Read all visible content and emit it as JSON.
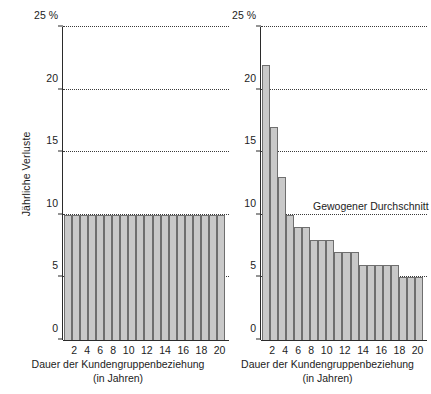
{
  "chart_data": [
    {
      "type": "bar",
      "panel": "left",
      "title": "",
      "xlabel": "Dauer der Kundengruppenbeziehung (in Jahren)",
      "xlabel_line1": "Dauer der Kundengruppenbeziehung",
      "xlabel_line2": "(in Jahren)",
      "ylabel": "Jährliche Verluste",
      "ylim": [
        0,
        25
      ],
      "yticks": [
        0,
        5,
        10,
        15,
        20,
        25
      ],
      "ytick_labels": [
        "0",
        "5",
        "10",
        "15",
        "20",
        "25 %"
      ],
      "grid": true,
      "grid_values": [
        5,
        10,
        15,
        20,
        25
      ],
      "x": [
        1,
        2,
        3,
        4,
        5,
        6,
        7,
        8,
        9,
        10,
        11,
        12,
        13,
        14,
        15,
        16,
        17,
        18,
        19,
        20
      ],
      "xtick_labels": [
        "",
        "2",
        "",
        "4",
        "",
        "6",
        "",
        "8",
        "",
        "10",
        "",
        "12",
        "",
        "14",
        "",
        "16",
        "",
        "18",
        "",
        "20"
      ],
      "categories": [
        "1",
        "2",
        "3",
        "4",
        "5",
        "6",
        "7",
        "8",
        "9",
        "10",
        "11",
        "12",
        "13",
        "14",
        "15",
        "16",
        "17",
        "18",
        "19",
        "20"
      ],
      "values": [
        10,
        10,
        10,
        10,
        10,
        10,
        10,
        10,
        10,
        10,
        10,
        10,
        10,
        10,
        10,
        10,
        10,
        10,
        10,
        10
      ],
      "bar_fill": "#c9c9c9",
      "bar_edge": "#6f6f6f"
    },
    {
      "type": "bar",
      "panel": "right",
      "title": "",
      "xlabel": "Dauer der Kundengruppenbeziehung (in Jahren)",
      "xlabel_line1": "Dauer der Kundengruppenbeziehung",
      "xlabel_line2": "(in Jahren)",
      "ylabel": "Jährliche Verluste",
      "ylim": [
        0,
        25
      ],
      "yticks": [
        0,
        5,
        10,
        15,
        20,
        25
      ],
      "ytick_labels": [
        "0",
        "5",
        "10",
        "15",
        "20",
        "25 %"
      ],
      "grid": true,
      "grid_values": [
        5,
        10,
        15,
        20,
        25
      ],
      "x": [
        1,
        2,
        3,
        4,
        5,
        6,
        7,
        8,
        9,
        10,
        11,
        12,
        13,
        14,
        15,
        16,
        17,
        18,
        19,
        20
      ],
      "xtick_labels": [
        "",
        "2",
        "",
        "4",
        "",
        "6",
        "",
        "8",
        "",
        "10",
        "",
        "12",
        "",
        "14",
        "",
        "16",
        "",
        "18",
        "",
        "20"
      ],
      "categories": [
        "1",
        "2",
        "3",
        "4",
        "5",
        "6",
        "7",
        "8",
        "9",
        "10",
        "11",
        "12",
        "13",
        "14",
        "15",
        "16",
        "17",
        "18",
        "19",
        "20"
      ],
      "values": [
        22,
        17,
        13,
        10,
        9,
        9,
        8,
        8,
        8,
        7,
        7,
        7,
        6,
        6,
        6,
        6,
        6,
        5,
        5,
        5
      ],
      "bar_fill": "#c9c9c9",
      "bar_edge": "#6f6f6f",
      "annotations": [
        {
          "text": "Gewogener Durchschnitt",
          "value": 10
        }
      ]
    }
  ]
}
